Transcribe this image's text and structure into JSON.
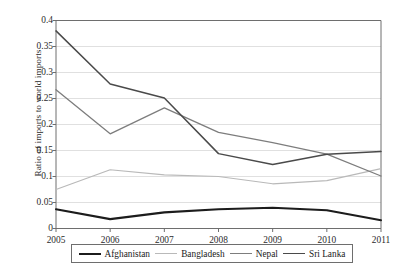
{
  "chart_data": {
    "type": "line",
    "title": "",
    "xlabel": "",
    "ylabel": "Ratio of imports to world imports",
    "categories": [
      "2005",
      "2006",
      "2007",
      "2008",
      "2009",
      "2010",
      "2011"
    ],
    "x": [
      2005,
      2006,
      2007,
      2008,
      2009,
      2010,
      2011
    ],
    "ylim": [
      0,
      0.4
    ],
    "yticks": [
      "0",
      "0.05",
      "0.1",
      "0.15",
      "0.2",
      "0.25",
      "0.3",
      "0.35",
      "0.4"
    ],
    "ytick_values": [
      0,
      0.05,
      0.1,
      0.15,
      0.2,
      0.25,
      0.3,
      0.35,
      0.4
    ],
    "grid": "horizontal",
    "legend_position": "below-axes",
    "series": [
      {
        "name": "Afghanistan",
        "color": "#1c1c1c",
        "width": 2.1,
        "values": [
          0.037,
          0.018,
          0.031,
          0.037,
          0.04,
          0.035,
          0.016
        ]
      },
      {
        "name": "Bangladesh",
        "color": "#b9b9b9",
        "width": 1.2,
        "values": [
          0.075,
          0.113,
          0.103,
          0.1,
          0.086,
          0.092,
          0.115
        ]
      },
      {
        "name": "Nepal",
        "color": "#7d7d7d",
        "width": 1.3,
        "values": [
          0.267,
          0.182,
          0.232,
          0.185,
          0.165,
          0.143,
          0.101
        ]
      },
      {
        "name": "Sri Lanka",
        "color": "#4a4a4a",
        "width": 1.5,
        "values": [
          0.38,
          0.278,
          0.251,
          0.144,
          0.123,
          0.143,
          0.148
        ]
      }
    ],
    "axis_color": "#6e6e6e",
    "grid_color": "#d8d8d8",
    "background": "#ffffff"
  }
}
